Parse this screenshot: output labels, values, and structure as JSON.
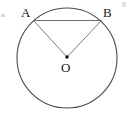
{
  "figure": {
    "type": "circle-geometry-diagram",
    "background_color": "#ffffff",
    "width": 131,
    "height": 122,
    "stroke_color": "#4a4a4a",
    "chord_color": "#5a5a5a",
    "radius_color": "#6e6e6e",
    "label_color": "#1a1a1a",
    "circle": {
      "center_x": 67,
      "center_y": 58,
      "radius": 50,
      "stroke_width": 1.1
    },
    "center_point": {
      "name": "center-dot",
      "x": 67,
      "y": 57,
      "radius": 1.7,
      "fill": "#111111"
    },
    "points": [
      {
        "id": "A",
        "label": "A",
        "x": 33.5,
        "y": 20.5
      },
      {
        "id": "B",
        "label": "B",
        "x": 101.5,
        "y": 20.5
      },
      {
        "id": "O",
        "label": "O",
        "x": 67,
        "y": 57
      }
    ],
    "segments": [
      {
        "id": "chord-AB",
        "from": "A",
        "to": "B",
        "label": "AB",
        "stroke_width": 0.9
      },
      {
        "id": "radius-OA",
        "from": "O",
        "to": "A",
        "label": "OA",
        "stroke_width": 0.9
      },
      {
        "id": "radius-OB",
        "from": "O",
        "to": "B",
        "label": "OB",
        "stroke_width": 0.9
      }
    ],
    "artifacts": [
      {
        "id": "artifact-left",
        "description": "scan-mark-left-edge"
      },
      {
        "id": "artifact-right",
        "description": "scan-mark-right-edge"
      }
    ]
  }
}
